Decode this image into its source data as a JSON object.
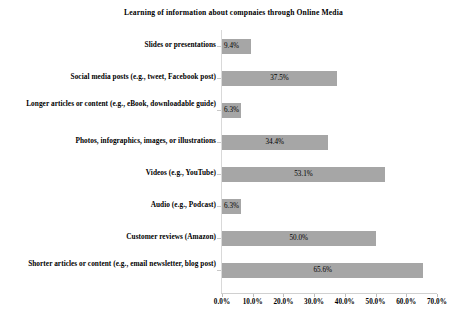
{
  "chart_data": {
    "type": "bar",
    "orientation": "horizontal",
    "title": "Learning of information about compnaies through Online Media",
    "xlabel": "",
    "ylabel": "",
    "categories": [
      "Slides or presentations",
      "Social media posts (e.g., tweet, Facebook post)",
      "Longer articles or content (e.g., eBook, downloadable guide)",
      "Photos, infographics, images, or illustrations",
      "Videos (e.g., YouTube)",
      "Audio (e.g., Podcast)",
      "Customer reviews (Amazon)",
      "Shorter articles or content (e.g., email newsletter, blog post)"
    ],
    "values": [
      9.4,
      37.5,
      6.3,
      34.4,
      53.1,
      6.3,
      50.0,
      65.6
    ],
    "data_labels": [
      "9.4%",
      "37.5%",
      "6.3%",
      "34.4%",
      "53.1%",
      "6.3%",
      "50.0%",
      "65.6%"
    ],
    "xlim": [
      0,
      70
    ],
    "xticks": [
      0,
      10,
      20,
      30,
      40,
      50,
      60,
      70
    ],
    "xtick_labels": [
      "0.0%",
      "10.0%",
      "20.0%",
      "30.0%",
      "40.0%",
      "50.0%",
      "60.0%",
      "70.0%"
    ],
    "grid": false,
    "legend": false,
    "bar_color": "#a6a6a6",
    "axis_color": "#d9d9d9",
    "background": "#ffffff"
  }
}
